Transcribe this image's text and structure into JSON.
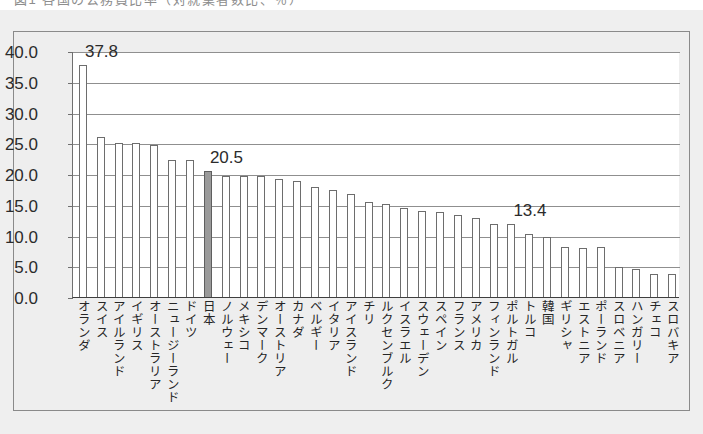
{
  "top_cut_text": "図1  各国の公務員比率（対就業者数比、％）",
  "chart_data": {
    "type": "bar",
    "title": "",
    "xlabel": "",
    "ylabel": "",
    "ylim": [
      0.0,
      40.0
    ],
    "ytick_step": 5.0,
    "grid": true,
    "legend": "none",
    "highlight_category": "日本",
    "highlight_color": "#9a9a9a",
    "bar_color": "#ffffff",
    "bar_border_color": "#6d6d6d",
    "ytick_labels": [
      "40.0",
      "35.0",
      "30.0",
      "25.0",
      "20.0",
      "15.0",
      "10.0",
      "5.0",
      "0.0"
    ],
    "annotations": [
      {
        "text": "37.8",
        "category": "オランダ"
      },
      {
        "text": "20.5",
        "category": "日本"
      },
      {
        "text": "13.4",
        "category": "ポルトガル"
      }
    ],
    "categories": [
      "オランダ",
      "スイス",
      "アイルランド",
      "イギリス",
      "オーストラリア",
      "ニュージーランド",
      "ドイツ",
      "日本",
      "ノルウェー",
      "メキシコ",
      "デンマーク",
      "オーストリア",
      "カナダ",
      "ベルギー",
      "イタリア",
      "アイスランド",
      "チリ",
      "ルクセンブルク",
      "イスラエル",
      "スウェーデン",
      "スペイン",
      "フランス",
      "アメリカ",
      "フィンランド",
      "ポルトガル",
      "トルコ",
      "韓国",
      "ギリシャ",
      "エストニア",
      "ポーランド",
      "スロベニア",
      "ハンガリー",
      "チェコ",
      "スロバキア"
    ],
    "values": [
      37.8,
      26.0,
      25.1,
      25.1,
      24.7,
      22.3,
      22.3,
      20.5,
      19.7,
      19.7,
      19.6,
      19.2,
      18.9,
      17.9,
      17.4,
      16.7,
      15.5,
      15.1,
      14.4,
      14.0,
      13.8,
      13.4,
      12.9,
      11.9,
      11.8,
      10.2,
      9.8,
      8.2,
      8.0,
      8.1,
      4.9,
      4.6,
      3.8,
      3.8
    ]
  }
}
